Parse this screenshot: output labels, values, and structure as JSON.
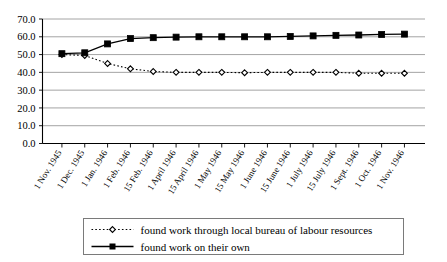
{
  "chart_data": {
    "type": "line",
    "title": "",
    "xlabel": "",
    "ylabel": "",
    "ylim": [
      0.0,
      70.0
    ],
    "ytick_step": 10.0,
    "grid": true,
    "legend_position": "bottom",
    "ytick_labels": [
      "0.0",
      "10.0",
      "20.0",
      "30.0",
      "40.0",
      "50.0",
      "60.0",
      "70.0"
    ],
    "ytick_values": [
      0.0,
      10.0,
      20.0,
      30.0,
      40.0,
      50.0,
      60.0,
      70.0
    ],
    "categories": [
      "1 Nov. 1945",
      "1 Dec. 1945",
      "1 Jan. 1946",
      "1 Feb. 1946",
      "15 Feb. 1946",
      "1 April 1946",
      "15 April 1946",
      "1 May 1946",
      "15 May 1946",
      "1 June 1946",
      "15 June 1946",
      "1 July 1946",
      "15 July 1946",
      "1 Sept. 1946",
      "1 Oct. 1946",
      "1 Nov. 1946"
    ],
    "series": [
      {
        "name": "found work through local bureau of labour resources",
        "marker": "open-diamond",
        "linestyle": "dotted",
        "color": "#000000",
        "values": [
          50.0,
          49.5,
          45.0,
          42.0,
          40.5,
          40.0,
          40.0,
          40.0,
          39.8,
          40.0,
          40.0,
          40.0,
          40.0,
          39.5,
          39.5,
          39.5
        ]
      },
      {
        "name": "found work on their own",
        "marker": "filled-square",
        "linestyle": "solid",
        "color": "#000000",
        "values": [
          50.5,
          51.0,
          56.0,
          59.0,
          59.5,
          59.8,
          60.0,
          60.0,
          60.0,
          60.0,
          60.2,
          60.5,
          60.8,
          61.0,
          61.3,
          61.5
        ]
      }
    ]
  },
  "legend": {
    "entries": [
      {
        "label": "found work through local bureau of labour resources",
        "style": "dotted-open-diamond"
      },
      {
        "label": "found work on their own",
        "style": "solid-filled-square"
      }
    ]
  }
}
